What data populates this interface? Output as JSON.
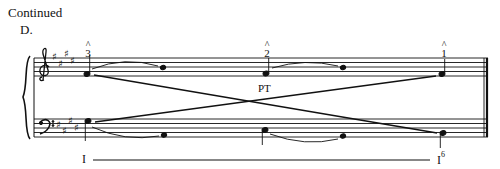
{
  "header": {
    "continued_label": "Continued",
    "section_label": "D."
  },
  "score": {
    "key_signature": "E major (4 sharps)",
    "treble_clef": "treble-clef",
    "bass_clef": "bass-clef",
    "scale_degrees": [
      {
        "caret": "^",
        "degree": "3"
      },
      {
        "caret": "^",
        "degree": "2"
      },
      {
        "caret": "^",
        "degree": "1"
      }
    ],
    "passing_tone_label": "PT",
    "roman_numerals": {
      "start": "I",
      "end": "I",
      "end_figure": "6"
    },
    "colors": {
      "ink": "#111111",
      "background": "#ffffff"
    }
  }
}
